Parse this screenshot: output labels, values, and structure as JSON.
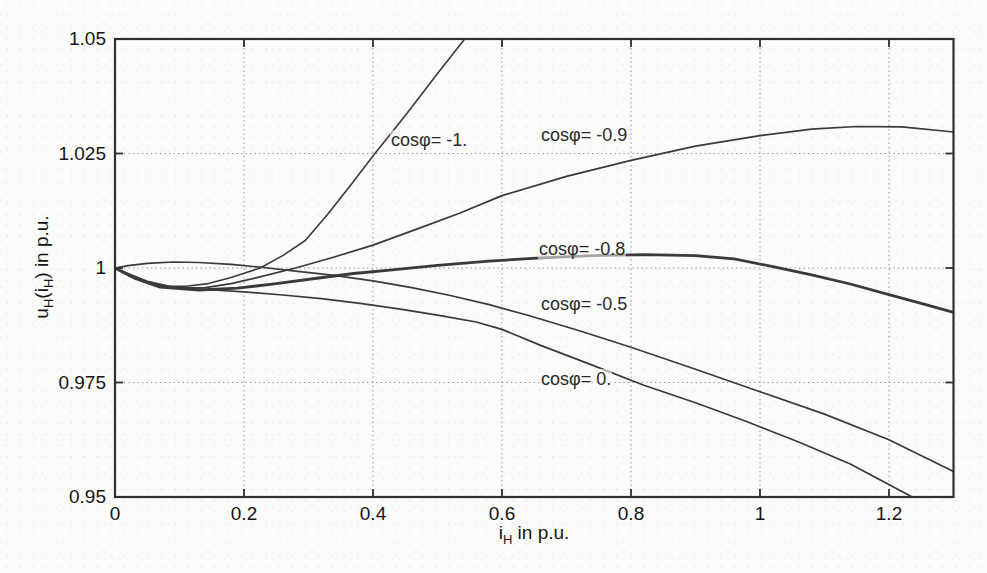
{
  "figure": {
    "width_px": 987,
    "height_px": 573,
    "background_color": "#fbfbf9",
    "axis_color": "#2f2f2f",
    "grid_color": "#8f8f8f",
    "text_color": "#161616",
    "curve_color": "#3a3a3a"
  },
  "axis_labels": {
    "x": {
      "p1": "i",
      "sub1": "H",
      "p2": " in p.u."
    },
    "y": {
      "p1": "u",
      "sub1": "H",
      "p2": "(i",
      "sub2": "H",
      "p3": ") in p.u."
    }
  },
  "chart_data": {
    "type": "line",
    "title": "",
    "xlabel": "i_H in p.u.",
    "ylabel": "u_H(i_H) in p.u.",
    "xlim": [
      0,
      1.3
    ],
    "ylim": [
      0.95,
      1.05
    ],
    "grid": "dotted",
    "legend_position": "inline-annotations",
    "x_ticks": [
      {
        "v": 0,
        "t": "0"
      },
      {
        "v": 0.2,
        "t": "0.2"
      },
      {
        "v": 0.4,
        "t": "0.4"
      },
      {
        "v": 0.6,
        "t": "0.6"
      },
      {
        "v": 0.8,
        "t": "0.8"
      },
      {
        "v": 1,
        "t": "1"
      },
      {
        "v": 1.2,
        "t": "1.2"
      }
    ],
    "y_ticks": [
      {
        "v": 0.95,
        "t": "0.95"
      },
      {
        "v": 0.975,
        "t": "0.975"
      },
      {
        "v": 1,
        "t": "1"
      },
      {
        "v": 1.025,
        "t": "1.025"
      },
      {
        "v": 1.05,
        "t": "1.05"
      }
    ],
    "series": [
      {
        "name": "cos_phi_-1",
        "label": "cosφ= -1.",
        "label_px": [
          390,
          130
        ],
        "stroke_width": 1.6,
        "x": [
          0,
          0.02,
          0.05,
          0.08,
          0.11,
          0.145,
          0.18,
          0.225,
          0.26,
          0.295,
          0.33,
          0.365,
          0.403,
          0.45,
          0.5,
          0.545
        ],
        "y": [
          1.0,
          0.9984,
          0.9968,
          0.996,
          0.996,
          0.9966,
          0.9979,
          1.0,
          1.0027,
          1.006,
          1.0118,
          1.018,
          1.025,
          1.0333,
          1.0425,
          1.0505
        ]
      },
      {
        "name": "cos_phi_-0.9",
        "label": "cosφ= -0.9",
        "label_px": [
          540,
          125
        ],
        "stroke_width": 1.7,
        "x": [
          0,
          0.03,
          0.06,
          0.1,
          0.14,
          0.18,
          0.22,
          0.28,
          0.34,
          0.4,
          0.47,
          0.535,
          0.6,
          0.7,
          0.8,
          0.9,
          1.0,
          1.08,
          1.15,
          1.22,
          1.3
        ],
        "y": [
          1.0,
          0.998,
          0.9964,
          0.9956,
          0.9957,
          0.9966,
          0.9979,
          1.0,
          1.0024,
          1.005,
          1.0086,
          1.012,
          1.0158,
          1.02,
          1.0235,
          1.0266,
          1.0289,
          1.0303,
          1.0309,
          1.0308,
          1.0297
        ]
      },
      {
        "name": "cos_phi_-0.8",
        "label": "cosφ= -0.8",
        "label_px": [
          538,
          239
        ],
        "stroke_width": 2.8,
        "x": [
          0,
          0.03,
          0.07,
          0.13,
          0.19,
          0.25,
          0.31,
          0.37,
          0.43,
          0.5,
          0.58,
          0.66,
          0.74,
          0.82,
          0.9,
          0.96,
          1.02,
          1.08,
          1.14,
          1.2,
          1.25,
          1.3
        ],
        "y": [
          1.0,
          0.9978,
          0.9958,
          0.9952,
          0.9956,
          0.9966,
          0.9977,
          0.9988,
          0.9996,
          1.0006,
          1.0015,
          1.0022,
          1.0027,
          1.0029,
          1.0027,
          1.002,
          1.0003,
          0.9985,
          0.9965,
          0.9942,
          0.9923,
          0.9903
        ]
      },
      {
        "name": "cos_phi_-0.5",
        "label": "cosφ= -0.5",
        "label_px": [
          540,
          294
        ],
        "stroke_width": 1.7,
        "x": [
          0,
          0.02,
          0.05,
          0.09,
          0.13,
          0.18,
          0.23,
          0.28,
          0.34,
          0.4,
          0.46,
          0.52,
          0.58,
          0.64,
          0.72,
          0.8,
          0.9,
          1.0,
          1.1,
          1.2,
          1.3
        ],
        "y": [
          1.0,
          1.0005,
          1.001,
          1.0013,
          1.0012,
          1.0008,
          1.0001,
          0.9993,
          0.9984,
          0.9972,
          0.9957,
          0.994,
          0.992,
          0.9897,
          0.9863,
          0.9827,
          0.9779,
          0.973,
          0.9681,
          0.9625,
          0.9556
        ]
      },
      {
        "name": "cos_phi_0",
        "label": "cosφ= 0.",
        "label_px": [
          540,
          369
        ],
        "stroke_width": 1.7,
        "x": [
          0,
          0.02,
          0.05,
          0.09,
          0.14,
          0.2,
          0.26,
          0.32,
          0.38,
          0.44,
          0.5,
          0.56,
          0.6,
          0.66,
          0.74,
          0.82,
          0.9,
          0.977,
          1.06,
          1.14,
          1.236
        ],
        "y": [
          1.0,
          0.9988,
          0.9971,
          0.9958,
          0.9953,
          0.9948,
          0.9941,
          0.9933,
          0.9923,
          0.9911,
          0.9897,
          0.9882,
          0.9866,
          0.9831,
          0.9788,
          0.9744,
          0.9706,
          0.9666,
          0.962,
          0.9572,
          0.95
        ]
      }
    ]
  }
}
